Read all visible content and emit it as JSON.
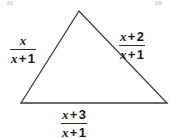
{
  "figure": {
    "type": "geometry-diagram",
    "shape": "triangle",
    "background_color": "#ffffff",
    "stroke_color": "#3a3a3a",
    "text_color": "#1b1b1b"
  },
  "triangle": {
    "vertices": {
      "apex": [
        79,
        11
      ],
      "bottom_left": [
        21,
        103
      ],
      "bottom_right": [
        167,
        103
      ]
    },
    "points_attr": "79,11 21,103 167,103"
  },
  "labels": {
    "left": {
      "name": "left-side-label",
      "numerator_var": "x",
      "numerator_op": "",
      "numerator_num": "",
      "denominator_var": "x",
      "denominator_op": "+",
      "denominator_num": "1",
      "text": "x/(x + 1)"
    },
    "right": {
      "name": "right-side-label",
      "numerator_var": "x",
      "numerator_op": "+",
      "numerator_num": "2",
      "denominator_var": "x",
      "denominator_op": "+",
      "denominator_num": "1",
      "text": "(x + 2)/(x + 1)"
    },
    "bottom": {
      "name": "bottom-side-label",
      "numerator_var": "x",
      "numerator_op": "+",
      "numerator_num": "3",
      "denominator_var": "x",
      "denominator_op": "+",
      "denominator_num": "1",
      "text": "(x + 3)/(x + 1)"
    }
  }
}
